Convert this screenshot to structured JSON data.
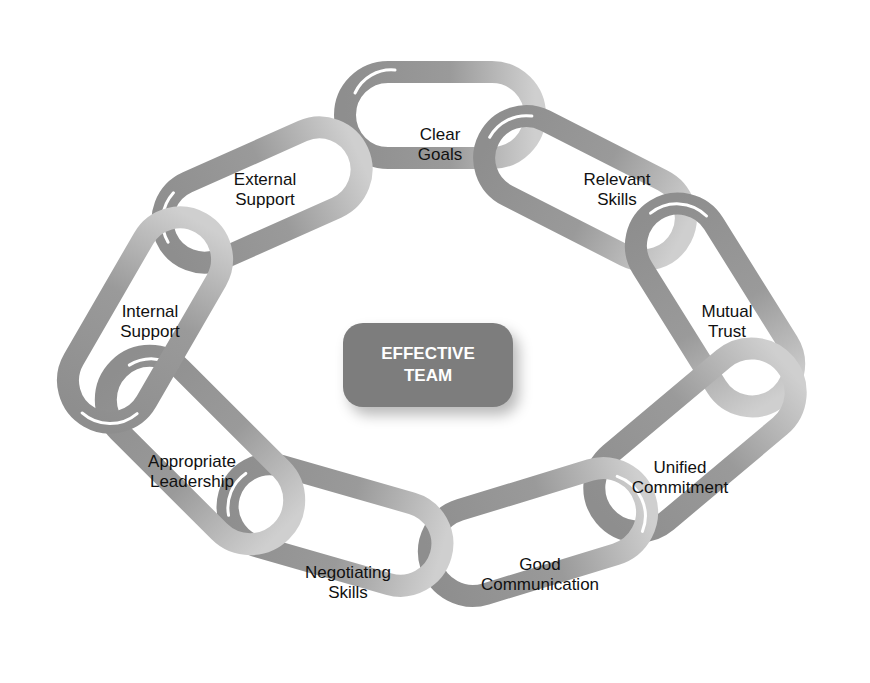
{
  "diagram": {
    "center": {
      "line1": "EFFECTIVE",
      "line2": "TEAM"
    },
    "links": [
      {
        "id": "clear-goals",
        "line1": "Clear",
        "line2": "Goals"
      },
      {
        "id": "relevant-skills",
        "line1": "Relevant",
        "line2": "Skills"
      },
      {
        "id": "mutual-trust",
        "line1": "Mutual",
        "line2": "Trust"
      },
      {
        "id": "unified-commitment",
        "line1": "Unified",
        "line2": "Commitment"
      },
      {
        "id": "good-communication",
        "line1": "Good",
        "line2": "Communication"
      },
      {
        "id": "negotiating-skills",
        "line1": "Negotiating",
        "line2": "Skills"
      },
      {
        "id": "appropriate-leadership",
        "line1": "Appropriate",
        "line2": "Leadership"
      },
      {
        "id": "internal-support",
        "line1": "Internal",
        "line2": "Support"
      },
      {
        "id": "external-support",
        "line1": "External",
        "line2": "Support"
      }
    ],
    "colors": {
      "link_dark": "#8c8c8c",
      "link_light": "#c8c8c8",
      "center_fill": "#7d7d7d",
      "highlight": "#ffffff"
    }
  }
}
